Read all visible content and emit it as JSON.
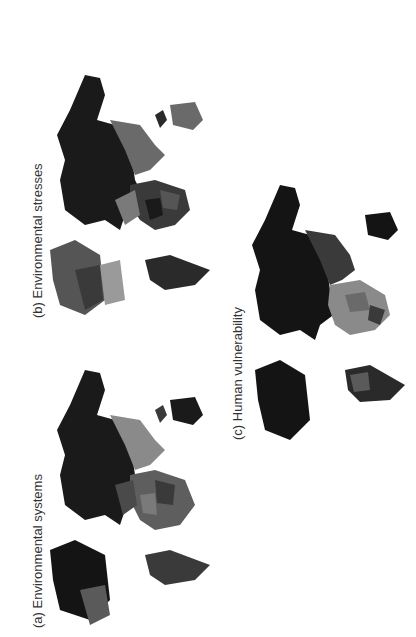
{
  "figure": {
    "panels": [
      {
        "id": "a",
        "label": "(a) Environmental systems"
      },
      {
        "id": "b",
        "label": "(b) Environmental stresses"
      },
      {
        "id": "c",
        "label": "(c) Human vulnerability"
      }
    ],
    "orientation": "rotated 90 degrees counter-clockwise",
    "color_scheme": "grayscale choropleth",
    "colors": {
      "darkest": "#141414",
      "dark": "#3a3a3a",
      "mid": "#5e5e5e",
      "light": "#8a8a8a",
      "lightest": "#aaaaaa"
    }
  }
}
